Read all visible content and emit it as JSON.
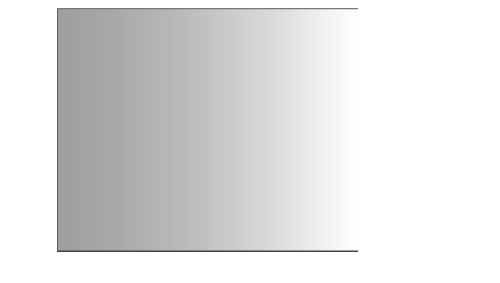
{
  "chart_data": {
    "type": "line",
    "title": "",
    "xlabel": "",
    "ylabel": "Rate per 100,000 (age adjusted)",
    "x": [
      1999,
      2000,
      2001,
      2002,
      2003,
      2004,
      2005,
      2006,
      2007,
      2008
    ],
    "xtick_labels": [
      "1999",
      "2000",
      "2001",
      "2002",
      "2003",
      "2004",
      "2005",
      "2006",
      "2007",
      "2008"
    ],
    "ytick_labels": [
      "0",
      "5",
      "10",
      "15",
      "20"
    ],
    "yticks": [
      0,
      5,
      10,
      15,
      20
    ],
    "ylim": [
      0,
      20
    ],
    "xlim": [
      1999,
      2008
    ],
    "grid": "horizontal",
    "legend_position": "right",
    "series": [
      {
        "name": "White, non-Hispanic",
        "color": "#d2d2d2",
        "values": [
          12.2,
          12.3,
          12.6,
          12.8,
          12.9,
          13.0,
          13.1,
          13.3,
          13.8,
          14.8
        ]
      },
      {
        "name": "American Indian or Alaska Native",
        "color": "#8c8c8c",
        "values": [
          10.0,
          9.4,
          10.3,
          10.4,
          10.0,
          12.3,
          11.3,
          10.4,
          11.6,
          12.2
        ]
      },
      {
        "name": "Total",
        "color": "#6e6e6e",
        "values": [
          10.7,
          10.4,
          10.8,
          11.0,
          10.9,
          11.1,
          11.0,
          11.1,
          11.4,
          11.8
        ]
      },
      {
        "name": "2020 Target",
        "color": "#8c8c8c",
        "values": [
          10.2,
          10.2,
          10.2,
          10.2,
          10.2,
          10.2,
          10.2,
          10.2,
          10.2,
          10.2
        ]
      },
      {
        "name": "Asian or Pacific Islander",
        "color": "#5a5a5a",
        "values": [
          5.9,
          5.7,
          5.6,
          5.4,
          5.3,
          5.6,
          5.3,
          5.1,
          6.1,
          5.4
        ]
      },
      {
        "name": "Hispanic or Latino",
        "color": "#3c3c3c",
        "values": [
          6.0,
          5.8,
          5.7,
          5.5,
          5.4,
          5.8,
          5.3,
          5.2,
          6.0,
          5.6
        ]
      },
      {
        "name": "Black, non-Hispanic",
        "color": "#2a2a2a",
        "values": [
          5.8,
          5.6,
          5.6,
          5.4,
          5.3,
          5.7,
          5.2,
          5.4,
          5.0,
          5.3
        ]
      }
    ]
  },
  "legend": {
    "upper": [
      {
        "label": "White, non-Hispanic",
        "color": "#d2d2d2"
      },
      {
        "label": "American Indian or",
        "color": "#8c8c8c"
      },
      {
        "label": "Total",
        "color": "#6e6e6e"
      }
    ],
    "upper_continuation": "Alaska Native",
    "target_label": "2020 Target",
    "lower": [
      {
        "label": "Asian or Pacific Islander",
        "color": "#5a5a5a"
      },
      {
        "label": "Hispanic or Latino",
        "color": "#3c3c3c"
      },
      {
        "label": "Black, non-Hispanic",
        "color": "#2a2a2a"
      }
    ]
  }
}
